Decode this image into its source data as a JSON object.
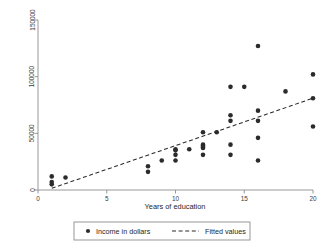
{
  "chart_data": {
    "type": "scatter",
    "title": "",
    "xlabel": "Years of education",
    "ylabel": "",
    "xlim": [
      0,
      20
    ],
    "ylim": [
      0,
      150000
    ],
    "xticks": [
      0,
      5,
      10,
      15,
      20
    ],
    "yticks": [
      0,
      50000,
      100000,
      150000
    ],
    "xtick_labels": [
      "0",
      "5",
      "10",
      "15",
      "20"
    ],
    "ytick_labels": [
      "0",
      "50000",
      "100000",
      "150000"
    ],
    "grid": false,
    "legend_position": "bottom-outside",
    "series": [
      {
        "name": "Income in dollars",
        "type": "scatter",
        "marker": "filled-circle",
        "color": "#2b2b2b",
        "points": [
          [
            1,
            12000
          ],
          [
            1,
            7000
          ],
          [
            1,
            5000
          ],
          [
            2,
            11000
          ],
          [
            8,
            21000
          ],
          [
            8,
            16000
          ],
          [
            9,
            26000
          ],
          [
            10,
            36000
          ],
          [
            10,
            35000
          ],
          [
            10,
            31000
          ],
          [
            10,
            26000
          ],
          [
            11,
            36000
          ],
          [
            12,
            51000
          ],
          [
            12,
            40000
          ],
          [
            12,
            39000
          ],
          [
            12,
            38000
          ],
          [
            12,
            37000
          ],
          [
            12,
            31000
          ],
          [
            13,
            51000
          ],
          [
            14,
            91000
          ],
          [
            14,
            66000
          ],
          [
            14,
            61000
          ],
          [
            14,
            40000
          ],
          [
            14,
            31000
          ],
          [
            15,
            91000
          ],
          [
            16,
            127000
          ],
          [
            16,
            70000
          ],
          [
            16,
            61000
          ],
          [
            16,
            46000
          ],
          [
            16,
            26000
          ],
          [
            18,
            87000
          ],
          [
            20,
            102000
          ],
          [
            20,
            81000
          ],
          [
            20,
            56000
          ]
        ]
      },
      {
        "name": "Fitted values",
        "type": "line",
        "style": "dashed",
        "color": "#2b2b2b",
        "x": [
          1,
          20
        ],
        "y": [
          1500,
          81000
        ]
      }
    ],
    "legend": [
      {
        "label": "Income in dollars",
        "marker": "filled-circle"
      },
      {
        "label": "Fitted values",
        "marker": "dashed-line"
      }
    ]
  }
}
